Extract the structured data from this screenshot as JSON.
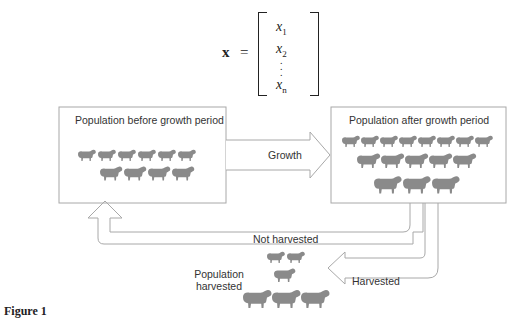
{
  "equation": {
    "lhs": "x",
    "equals": "=",
    "entries": [
      {
        "base": "x",
        "sub": "1"
      },
      {
        "base": "x",
        "sub": "2"
      },
      {
        "base": "x",
        "sub": "n"
      }
    ],
    "ellipsis": "⋮"
  },
  "boxes": {
    "before": {
      "title": "Population before growth period",
      "sheep_rows": [
        6,
        4
      ]
    },
    "after": {
      "title": "Population  after  growth period",
      "sheep_rows": [
        8,
        5,
        3
      ]
    }
  },
  "arrows": {
    "growth": "Growth",
    "not_harvested": "Not harvested",
    "harvested": "Harvested"
  },
  "harvested_group": {
    "label_line1": "Population",
    "label_line2": "harvested",
    "sheep_rows": [
      2,
      1,
      3
    ]
  },
  "caption": "Figure 1",
  "colors": {
    "sheep": "#8a8a8a",
    "outline": "#9a9a9a"
  }
}
